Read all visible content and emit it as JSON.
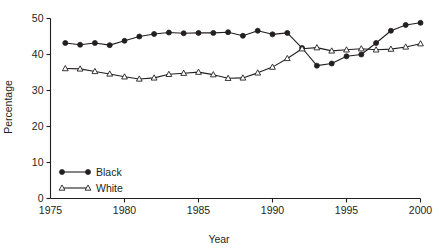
{
  "chart_data": {
    "type": "line",
    "title": "",
    "xlabel": "Year",
    "ylabel": "Percentage",
    "xlim": [
      1975,
      2000
    ],
    "ylim": [
      0,
      50
    ],
    "xticks": [
      1975,
      1980,
      1985,
      1990,
      1995,
      2000
    ],
    "xtick_labels": [
      "1975",
      "1980",
      "1985",
      "1990",
      "1995",
      "2000"
    ],
    "yticks": [
      0,
      10,
      20,
      30,
      40,
      50
    ],
    "ytick_labels": [
      "0",
      "10",
      "20",
      "30",
      "40",
      "50"
    ],
    "grid": false,
    "legend_position": "lower-left",
    "x": [
      1976,
      1977,
      1978,
      1979,
      1980,
      1981,
      1982,
      1983,
      1984,
      1985,
      1986,
      1987,
      1988,
      1989,
      1990,
      1991,
      1992,
      1993,
      1994,
      1995,
      1996,
      1997,
      1998,
      1999,
      2000
    ],
    "series": [
      {
        "name": "Black",
        "marker": "filled-circle",
        "color": "#231f20",
        "values": [
          43.2,
          42.7,
          43.2,
          42.6,
          43.8,
          45.0,
          45.7,
          46.1,
          45.9,
          46.0,
          46.0,
          46.2,
          45.2,
          46.6,
          45.6,
          46.0,
          41.8,
          36.9,
          37.5,
          39.5,
          40.0,
          43.2,
          46.6,
          48.2,
          48.8
        ]
      },
      {
        "name": "White",
        "marker": "open-triangle",
        "color": "#231f20",
        "values": [
          36.1,
          36.0,
          35.3,
          34.6,
          33.8,
          33.2,
          33.5,
          34.5,
          34.8,
          35.1,
          34.4,
          33.4,
          33.5,
          34.9,
          36.5,
          38.9,
          41.6,
          41.9,
          41.0,
          41.3,
          41.6,
          41.3,
          41.5,
          42.1,
          43.0
        ]
      }
    ]
  },
  "axes": {
    "xlabel": "Year",
    "ylabel": "Percentage"
  },
  "legend": {
    "items": [
      {
        "label": "Black",
        "marker": "filled-circle"
      },
      {
        "label": "White",
        "marker": "open-triangle"
      }
    ]
  }
}
